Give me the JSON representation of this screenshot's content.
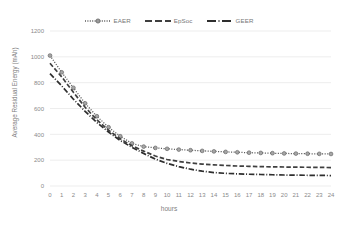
{
  "chart_data": {
    "type": "line",
    "title": "",
    "xlabel": "hours",
    "ylabel": "Average Residual Energy (mAh)",
    "xlim": [
      0,
      24
    ],
    "ylim": [
      0,
      1200
    ],
    "ytick_labels": [
      "0",
      "200",
      "400",
      "600",
      "800",
      "1000",
      "1200"
    ],
    "yticks": [
      0,
      200,
      400,
      600,
      800,
      1000,
      1200
    ],
    "xtick_labels": [
      "0",
      "1",
      "2",
      "3",
      "4",
      "5",
      "6",
      "7",
      "8",
      "9",
      "10",
      "11",
      "12",
      "13",
      "14",
      "15",
      "16",
      "17",
      "18",
      "19",
      "20",
      "21",
      "22",
      "23",
      "24"
    ],
    "x": [
      0,
      1,
      2,
      3,
      4,
      5,
      6,
      7,
      8,
      9,
      10,
      11,
      12,
      13,
      14,
      15,
      16,
      17,
      18,
      19,
      20,
      21,
      22,
      23,
      24
    ],
    "grid": true,
    "legend_position": "top-center",
    "series": [
      {
        "name": "EAER",
        "style": "dotted",
        "marker": "circle",
        "color": "#595959",
        "values": [
          1010,
          880,
          760,
          640,
          540,
          455,
          385,
          330,
          305,
          295,
          288,
          282,
          277,
          272,
          268,
          264,
          261,
          258,
          256,
          254,
          252,
          251,
          250,
          249,
          248
        ]
      },
      {
        "name": "EpSoc",
        "style": "dashed",
        "marker": "none",
        "color": "#3f3f3f",
        "values": [
          950,
          845,
          725,
          610,
          512,
          432,
          365,
          312,
          270,
          232,
          205,
          190,
          178,
          170,
          164,
          159,
          155,
          152,
          150,
          148,
          147,
          146,
          145,
          144,
          143
        ]
      },
      {
        "name": "GEER",
        "style": "dashdot",
        "marker": "none",
        "color": "#2e2e2e",
        "values": [
          870,
          775,
          672,
          578,
          492,
          418,
          352,
          300,
          252,
          208,
          175,
          150,
          130,
          115,
          104,
          98,
          94,
          91,
          89,
          87,
          85,
          84,
          83,
          82,
          81
        ]
      }
    ]
  },
  "legend": {
    "entries": [
      {
        "label": "EAER"
      },
      {
        "label": "EpSoc"
      },
      {
        "label": "GEER"
      }
    ]
  },
  "axes": {
    "x_title": "hours",
    "y_title": "Average Residual Energy (mAh)"
  },
  "colors": {
    "grid": "#e8e8e8",
    "text": "#808080",
    "series_1": "#595959",
    "series_2": "#3f3f3f",
    "series_3": "#2e2e2e",
    "background": "#ffffff"
  }
}
